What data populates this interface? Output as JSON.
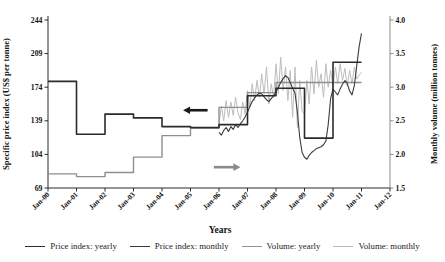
{
  "chart_data": {
    "type": "line",
    "xlabel": "Years",
    "ylabel_left": "Specific price index (US$ per tonne)",
    "ylabel_right": "Monthly volume (million tonnes)",
    "x_ticks": [
      "Jan-00",
      "Jan-01",
      "Jan-02",
      "Jan-03",
      "Jan-04",
      "Jan-05",
      "Jan-06",
      "Jan-07",
      "Jan-08",
      "Jan-09",
      "Jan-10",
      "Jan-11",
      "Jan-12"
    ],
    "x_range": [
      2000,
      2012
    ],
    "y_left_ticks": [
      69,
      104,
      139,
      174,
      209,
      244
    ],
    "y_left_range": [
      69,
      244
    ],
    "y_right_ticks": [
      "1.5",
      "2.0",
      "2.5",
      "3.0",
      "3.5",
      "4.0"
    ],
    "y_right_range": [
      1.5,
      4.0
    ],
    "grid": false,
    "legend_position": "bottom",
    "series": [
      {
        "name": "Price index: yearly",
        "type": "step",
        "axis": "left",
        "color": "#2b2b2b",
        "width": 1.6,
        "x_start": 2000,
        "x_step": 1,
        "values": [
          180,
          125,
          146,
          142,
          133,
          132,
          135,
          165,
          173,
          121,
          200
        ]
      },
      {
        "name": "Price index: monthly",
        "type": "line",
        "axis": "left",
        "color": "#3c3c3c",
        "width": 1.1,
        "x_start": 2006,
        "x_step": 0.0833333,
        "values": [
          127,
          124,
          129,
          132,
          128,
          133,
          130,
          135,
          132,
          136,
          139,
          143,
          148,
          154,
          159,
          163,
          166,
          168,
          167,
          164,
          161,
          159,
          162,
          165,
          169,
          174,
          179,
          183,
          186,
          184,
          179,
          173,
          168,
          148,
          122,
          106,
          101,
          99,
          103,
          106,
          108,
          110,
          111,
          112,
          114,
          118,
          135,
          162,
          172,
          169,
          166,
          172,
          177,
          181,
          178,
          170,
          166,
          176,
          196,
          216,
          230
        ]
      },
      {
        "name": "Volume: yearly",
        "type": "step",
        "axis": "right",
        "color": "#8f8f8f",
        "width": 1.4,
        "x_start": 2000,
        "x_step": 1,
        "values": [
          1.71,
          1.67,
          1.73,
          1.96,
          2.28,
          2.39,
          2.7,
          2.92,
          3.07,
          3.07,
          3.07
        ]
      },
      {
        "name": "Volume: monthly",
        "type": "line",
        "axis": "right",
        "color": "#bdbdbd",
        "width": 1.0,
        "x_start": 2006,
        "x_step": 0.0833333,
        "values": [
          2.45,
          2.72,
          2.5,
          2.8,
          2.55,
          2.78,
          2.58,
          2.85,
          2.62,
          2.52,
          2.78,
          2.6,
          2.95,
          2.7,
          3.05,
          2.8,
          3.1,
          2.85,
          3.2,
          2.9,
          3.3,
          2.75,
          3.05,
          2.85,
          3.35,
          2.9,
          3.45,
          2.95,
          3.3,
          2.8,
          3.25,
          2.55,
          3.3,
          2.4,
          3.1,
          2.65,
          2.6,
          3.1,
          2.75,
          3.3,
          2.9,
          3.4,
          3.0,
          3.2,
          2.85,
          3.35,
          3.0,
          3.25,
          3.0,
          3.3,
          3.05,
          3.35,
          3.1,
          3.28,
          3.02,
          3.25,
          3.05,
          3.3,
          3.12,
          3.18,
          3.22
        ]
      }
    ],
    "annotations": [
      {
        "name": "price-axis-arrow",
        "direction": "left",
        "color": "#1a1a1a",
        "axis": "left",
        "tip_x": 2004.74,
        "tail_x": 2005.6,
        "y": 150
      },
      {
        "name": "volume-axis-arrow",
        "direction": "right",
        "color": "#8a8a8a",
        "axis": "right",
        "tip_x": 2006.75,
        "tail_x": 2005.82,
        "y": 1.81
      }
    ]
  }
}
